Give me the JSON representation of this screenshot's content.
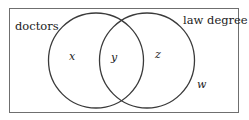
{
  "diagram": {
    "type": "venn",
    "universe": {
      "label": "",
      "variable": "w"
    },
    "sets": [
      {
        "id": "doctors",
        "label": "doctors"
      },
      {
        "id": "law_degree",
        "label": "law degree"
      }
    ],
    "regions": {
      "doctors_only": "x",
      "both": "y",
      "law_degree_only": "z",
      "neither": "w"
    },
    "colors": {
      "stroke": "#3a3a3a",
      "border": "#6f6f6f",
      "text": "#222222",
      "background": "#ffffff"
    }
  }
}
